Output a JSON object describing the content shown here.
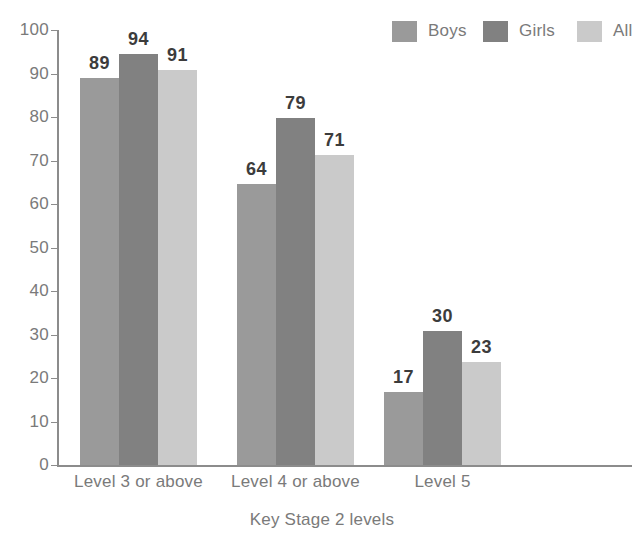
{
  "chart_data": {
    "type": "bar",
    "title": "",
    "xlabel": "Key Stage 2 levels",
    "ylabel": "",
    "ylim": [
      0,
      100
    ],
    "ytick_step": 10,
    "yticks": [
      "0",
      "10",
      "20",
      "30",
      "40",
      "50",
      "60",
      "70",
      "80",
      "90",
      "100"
    ],
    "categories": [
      "Level 3 or above",
      "Level 4 or above",
      "Level 5"
    ],
    "grid": false,
    "legend_position": "top-right",
    "series": [
      {
        "name": "Boys",
        "color": "#9a9a9a",
        "values": [
          89,
          64,
          17
        ],
        "drawn_values": [
          89,
          64.5,
          16.8
        ]
      },
      {
        "name": "Girls",
        "color": "#818181",
        "values": [
          94,
          79,
          30
        ],
        "drawn_values": [
          94.6,
          79.8,
          30.8
        ]
      },
      {
        "name": "All",
        "color": "#cacaca",
        "values": [
          91,
          71,
          23
        ],
        "drawn_values": [
          90.8,
          71.2,
          23.6
        ]
      }
    ],
    "colors": {
      "axis": "#8c8c8c",
      "tick_text": "#7a7a7a",
      "value_label": "#3c3c3c",
      "background": "#ffffff"
    }
  },
  "legend": {
    "items": [
      {
        "label": "Boys",
        "color": "#9a9a9a"
      },
      {
        "label": "Girls",
        "color": "#818181"
      },
      {
        "label": "All",
        "color": "#cacaca"
      }
    ]
  },
  "axis": {
    "x_title": "Key Stage 2 levels"
  }
}
